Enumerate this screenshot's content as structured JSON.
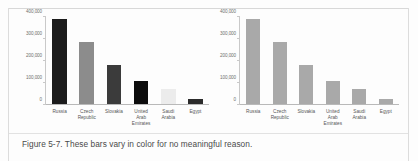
{
  "caption": "Figure 5-7. These bars vary in color for no meaningful reason.",
  "chart_data": [
    {
      "type": "bar",
      "name": "left-chart-varied-colors",
      "title": "",
      "xlabel": "",
      "ylabel": "",
      "categories": [
        "Russia",
        "Czech Republic",
        "Slovakia",
        "United Arab Emirates",
        "Saudi Arabia",
        "Egypt"
      ],
      "values": [
        390000,
        285000,
        178000,
        105000,
        70000,
        25000
      ],
      "ylim": [
        0,
        400000
      ],
      "yticks": [
        0,
        100000,
        200000,
        300000,
        400000
      ],
      "ytick_labels": [
        "0",
        "100,000",
        "200,000",
        "300,000",
        "400,000"
      ],
      "grid": false,
      "legend": "none",
      "bar_colors": [
        "#1c1c1c",
        "#8c8c8c",
        "#3b3b3b",
        "#0c0c0c",
        "#ececec",
        "#2b2b2b"
      ]
    },
    {
      "type": "bar",
      "name": "right-chart-uniform-color",
      "title": "",
      "xlabel": "",
      "ylabel": "",
      "categories": [
        "Russia",
        "Czech Republic",
        "Slovakia",
        "United Arab Emirates",
        "Saudi Arabia",
        "Egypt"
      ],
      "values": [
        390000,
        285000,
        178000,
        105000,
        70000,
        25000
      ],
      "ylim": [
        0,
        400000
      ],
      "yticks": [
        0,
        100000,
        200000,
        300000,
        400000
      ],
      "ytick_labels": [
        "0",
        "100,000",
        "200,000",
        "300,000",
        "400,000"
      ],
      "grid": false,
      "legend": "none",
      "bar_colors": [
        "#a9a9a9",
        "#a9a9a9",
        "#a9a9a9",
        "#a9a9a9",
        "#a9a9a9",
        "#a9a9a9"
      ]
    }
  ]
}
